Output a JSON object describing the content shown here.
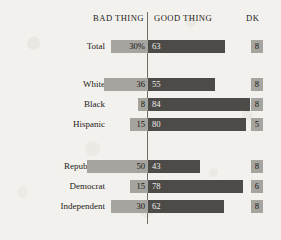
{
  "chart_data": {
    "type": "bar",
    "title": "",
    "subtitle": "",
    "xlabel": "",
    "ylabel": "",
    "orientation": "horizontal",
    "style": "diverging-stacked",
    "grid": false,
    "legend_position": "top",
    "axis_center_label": "0",
    "columns": [
      "BAD THING",
      "GOOD THING",
      "DK"
    ],
    "categories": [
      "Total",
      "White",
      "Black",
      "Hispanic",
      "Republican",
      "Democrat",
      "Independent"
    ],
    "series": [
      {
        "name": "BAD THING",
        "values": [
          30,
          36,
          8,
          15,
          50,
          15,
          30
        ]
      },
      {
        "name": "GOOD THING",
        "values": [
          63,
          55,
          84,
          80,
          43,
          78,
          62
        ]
      },
      {
        "name": "DK",
        "values": [
          8,
          8,
          8,
          5,
          8,
          6,
          8
        ]
      }
    ],
    "value_labels": {
      "BAD THING": [
        "30%",
        "36",
        "8",
        "15",
        "50",
        "15",
        "30"
      ],
      "GOOD THING": [
        "63",
        "55",
        "84",
        "80",
        "43",
        "78",
        "62"
      ],
      "DK": [
        "8",
        "8",
        "8",
        "5",
        "8",
        "6",
        "8"
      ]
    },
    "colors": {
      "bad_thing": "#a6a49f",
      "good_thing": "#4d4b48",
      "dk": "#a6a49f",
      "background": "#f3f1ed",
      "axis": "#6f6c66",
      "text": "#1c1a18"
    }
  },
  "header": {
    "bad_thing": "BAD THING",
    "good_thing": "GOOD THING",
    "dk": "DK"
  },
  "rows": [
    {
      "label": "Total",
      "bad_label": "30%",
      "bad_value": 30,
      "good_label": "63",
      "good_value": 63,
      "dk_label": "8",
      "dk_value": 8,
      "group": 0
    },
    {
      "label": "White",
      "bad_label": "36",
      "bad_value": 36,
      "good_label": "55",
      "good_value": 55,
      "dk_label": "8",
      "dk_value": 8,
      "group": 1
    },
    {
      "label": "Black",
      "bad_label": "8",
      "bad_value": 8,
      "good_label": "84",
      "good_value": 84,
      "dk_label": "8",
      "dk_value": 8,
      "group": 1
    },
    {
      "label": "Hispanic",
      "bad_label": "15",
      "bad_value": 15,
      "good_label": "80",
      "good_value": 80,
      "dk_label": "5",
      "dk_value": 5,
      "group": 1
    },
    {
      "label": "Republican",
      "bad_label": "50",
      "bad_value": 50,
      "good_label": "43",
      "good_value": 43,
      "dk_label": "8",
      "dk_value": 8,
      "group": 2
    },
    {
      "label": "Democrat",
      "bad_label": "15",
      "bad_value": 15,
      "good_label": "78",
      "good_value": 78,
      "dk_label": "6",
      "dk_value": 6,
      "group": 2
    },
    {
      "label": "Independent",
      "bad_label": "30",
      "bad_value": 30,
      "good_label": "62",
      "good_value": 62,
      "dk_label": "8",
      "dk_value": 8,
      "group": 2
    }
  ],
  "layout": {
    "axis_x": 147,
    "row_tops": [
      40,
      78,
      98,
      118,
      160,
      180,
      200
    ],
    "px_per_unit": 1.22
  }
}
